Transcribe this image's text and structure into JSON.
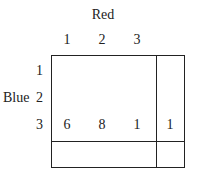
{
  "table": {
    "column_header": "Red",
    "row_header": "Blue",
    "columns": [
      "1",
      "2",
      "3"
    ],
    "rows": [
      "1",
      "2",
      "3"
    ],
    "row3_values": [
      "6",
      "8",
      "1",
      "1"
    ]
  }
}
